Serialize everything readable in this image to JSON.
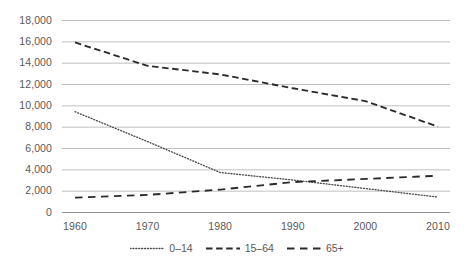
{
  "chart_data": {
    "type": "line",
    "title": "",
    "xlabel": "",
    "ylabel": "",
    "x": [
      1960,
      1970,
      1980,
      1990,
      2000,
      2010
    ],
    "categories": [
      "1960",
      "1970",
      "1980",
      "1990",
      "2000",
      "2010"
    ],
    "xlim": [
      1960,
      2010
    ],
    "ylim": [
      0,
      18000
    ],
    "ytick_labels": [
      "18,000",
      "16,000",
      "14,000",
      "12,000",
      "10,000",
      "8,000",
      "6,000",
      "4,000",
      "2,000",
      "0"
    ],
    "ytick_values": [
      18000,
      16000,
      14000,
      12000,
      10000,
      8000,
      6000,
      4000,
      2000,
      0
    ],
    "grid": true,
    "grid_axis": "y",
    "legend_position": "bottom",
    "series": [
      {
        "name": "0–14",
        "style": "dotted",
        "color": "#4d4d4f",
        "values": [
          9400,
          6600,
          3700,
          3000,
          2200,
          1400
        ]
      },
      {
        "name": "15–64",
        "style": "dashed",
        "color": "#2b2b2b",
        "values": [
          15900,
          13700,
          12900,
          11600,
          10400,
          8000
        ]
      },
      {
        "name": "65+",
        "style": "dashed-long",
        "color": "#2b2b2b",
        "values": [
          1350,
          1600,
          2100,
          2800,
          3100,
          3400
        ]
      }
    ]
  },
  "colors": {
    "gridline": "#b4b4b6",
    "axis": "#929295",
    "text": "#59595b",
    "background": "#ffffff"
  }
}
